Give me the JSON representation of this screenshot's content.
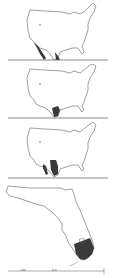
{
  "colors": {
    "outline": "#777777",
    "shade": "#3a3a3a",
    "rule": "#555555",
    "background": "#ffffff"
  },
  "panels": [
    {
      "id": "map-1",
      "region": "United States",
      "shaded": "south Texas / northern Mexico border region",
      "mark": "✓"
    },
    {
      "id": "map-2",
      "region": "United States",
      "shaded": "south Texas"
    },
    {
      "id": "map-3",
      "region": "United States",
      "shaded": "southwest New Mexico / west Texas and northern Mexico"
    },
    {
      "id": "map-4",
      "region": "Florida",
      "shaded": "southern Florida peninsula"
    }
  ],
  "scale_bar": {
    "left_label": "100",
    "mid_label": "0 0"
  }
}
